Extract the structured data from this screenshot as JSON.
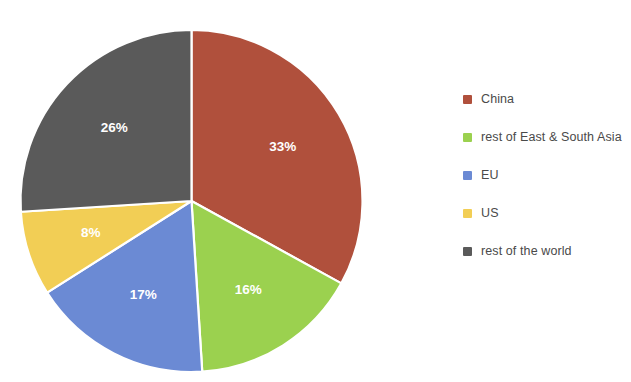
{
  "chart_data": {
    "type": "pie",
    "title": "",
    "subtitle": "",
    "xlabel": "",
    "ylabel": "",
    "grid": false,
    "legend_position": "right",
    "start_angle_deg": 0,
    "direction": "clockwise",
    "categories": [
      "China",
      "rest of East & South Asia",
      "EU",
      "US",
      "rest of the world"
    ],
    "values": [
      33,
      16,
      17,
      8,
      26
    ],
    "value_unit": "%",
    "data_labels": [
      "33%",
      "16%",
      "17%",
      "8%",
      "26%"
    ],
    "colors": [
      "#b0503c",
      "#9bd14f",
      "#6b8ad4",
      "#f2ce55",
      "#5a5a5a"
    ],
    "slices": [
      {
        "label": "China",
        "value": 33,
        "data_label": "33%",
        "color": "#b0503c"
      },
      {
        "label": "rest of East & South Asia",
        "value": 16,
        "data_label": "16%",
        "color": "#9bd14f"
      },
      {
        "label": "EU",
        "value": 17,
        "data_label": "17%",
        "color": "#6b8ad4"
      },
      {
        "label": "US",
        "value": 8,
        "data_label": "8%",
        "color": "#f2ce55"
      },
      {
        "label": "rest of the world",
        "value": 26,
        "data_label": "26%",
        "color": "#5a5a5a"
      }
    ]
  },
  "legend": {
    "items": [
      {
        "label": "China",
        "color": "#b0503c"
      },
      {
        "label": "rest of East & South Asia",
        "color": "#9bd14f"
      },
      {
        "label": "EU",
        "color": "#6b8ad4"
      },
      {
        "label": "US",
        "color": "#f2ce55"
      },
      {
        "label": "rest of the world",
        "color": "#5a5a5a"
      }
    ]
  },
  "canvas": {
    "background": "#ffffff",
    "slice_border_color": "#ffffff",
    "label_text_color": "#ffffff",
    "legend_text_color": "#4a4a4a"
  }
}
